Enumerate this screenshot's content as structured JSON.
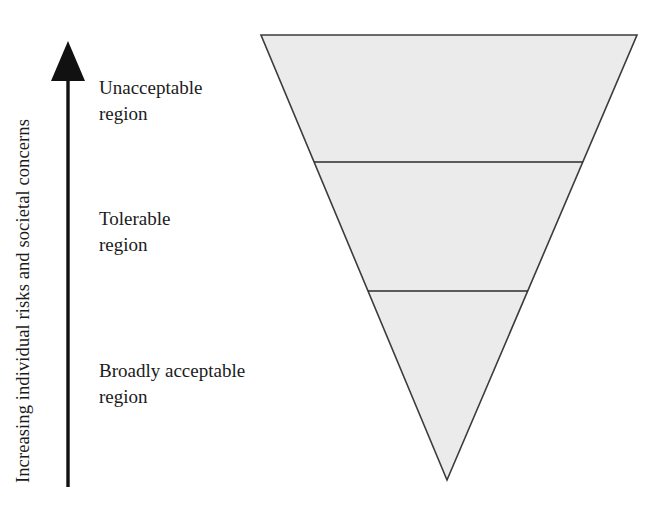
{
  "figure": {
    "type": "risk-tolerability-inverted-triangle",
    "axis": {
      "label": "Increasing individual risks and societal concerns",
      "direction": "upward",
      "arrow_icon": "up-arrow-icon"
    },
    "regions": [
      {
        "id": "unacceptable",
        "line1": "Unacceptable",
        "line2": "region",
        "fill_color": "#ebebeb",
        "order": 1
      },
      {
        "id": "tolerable",
        "line1": "Tolerable",
        "line2": "region",
        "fill_color": "#ebebeb",
        "order": 2
      },
      {
        "id": "broadly-acceptable",
        "line1": "Broadly acceptable",
        "line2": "region",
        "fill_color": "#ebebeb",
        "order": 3
      }
    ],
    "colors": {
      "triangle_fill": "#ebebeb",
      "triangle_stroke": "#3c3c3c",
      "divider_stroke": "#2b2b2b",
      "arrow": "#111111",
      "text": "#1b1b1b",
      "background": "#ffffff"
    }
  },
  "chart_data": {
    "type": "diagram",
    "title": "",
    "shape": "inverted-triangle",
    "triangle_vertices": [
      [
        261,
        35
      ],
      [
        637,
        35
      ],
      [
        447,
        480
      ]
    ],
    "dividers_y": [
      162,
      291
    ],
    "bands": [
      {
        "label": "Unacceptable region",
        "top_y": 35,
        "bottom_y": 162
      },
      {
        "label": "Tolerable region",
        "top_y": 162,
        "bottom_y": 291
      },
      {
        "label": "Broadly acceptable region",
        "top_y": 291,
        "bottom_y": 480
      }
    ],
    "ylabel": "Increasing individual risks and societal concerns",
    "xlabel": "",
    "legend": []
  }
}
